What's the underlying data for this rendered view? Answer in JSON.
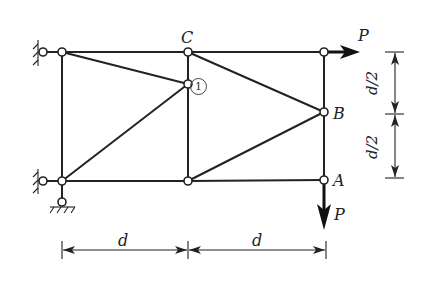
{
  "diagram": {
    "type": "plane truss",
    "labels": {
      "node_C": "C",
      "node_B": "B",
      "node_A": "A",
      "member_1": "1",
      "force_horizontal": "P",
      "force_vertical": "P"
    },
    "dimensions": {
      "bottom_left": "d",
      "bottom_right": "d",
      "right_upper": "d/2",
      "right_lower": "d/2"
    },
    "nodes": [
      {
        "id": "TL",
        "x": 62,
        "y": 52
      },
      {
        "id": "C",
        "x": 188,
        "y": 52
      },
      {
        "id": "TR",
        "x": 324,
        "y": 52
      },
      {
        "id": "M",
        "x": 188,
        "y": 84
      },
      {
        "id": "B",
        "x": 324,
        "y": 112
      },
      {
        "id": "BL",
        "x": 62,
        "y": 181
      },
      {
        "id": "BM",
        "x": 188,
        "y": 181
      },
      {
        "id": "A",
        "x": 324,
        "y": 180
      }
    ],
    "members": [
      [
        "TL",
        "C"
      ],
      [
        "C",
        "TR"
      ],
      [
        "BL",
        "BM"
      ],
      [
        "BM",
        "A"
      ],
      [
        "TL",
        "BL"
      ],
      [
        "C",
        "M"
      ],
      [
        "M",
        "BM"
      ],
      [
        "TR",
        "B"
      ],
      [
        "B",
        "A"
      ],
      [
        "TL",
        "M"
      ],
      [
        "M",
        "BL"
      ],
      [
        "C",
        "B"
      ],
      [
        "B",
        "BM"
      ]
    ],
    "supports": [
      {
        "type": "pin-wall",
        "at": "TL"
      },
      {
        "type": "pin-wall",
        "at": "BL"
      },
      {
        "type": "pin-ground",
        "at": "BL"
      }
    ],
    "loads": [
      {
        "at": "TR",
        "direction": "right",
        "label": "P"
      },
      {
        "at": "A",
        "direction": "down",
        "label": "P"
      }
    ]
  }
}
